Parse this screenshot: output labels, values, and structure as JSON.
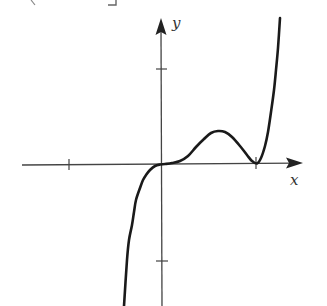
{
  "chart_data": {
    "type": "line",
    "title": "",
    "xlabel": "x",
    "ylabel": "y",
    "x_ticks": [
      -1,
      1
    ],
    "y_ticks": [
      -1,
      1
    ],
    "tick_labels_shown": false,
    "grid": false,
    "legend": null,
    "xlim": [
      -1.5,
      1.5
    ],
    "ylim": [
      -1.5,
      1.5
    ],
    "key_points": [
      {
        "label": "origin inflection",
        "x": 0,
        "y": 0
      },
      {
        "label": "local max",
        "x": 0.6,
        "y": 0.35
      },
      {
        "label": "double root (local min)",
        "x": 1,
        "y": 0
      }
    ],
    "series": [
      {
        "name": "f(x)",
        "points_px": [
          [
            124,
            306
          ],
          [
            127,
            260
          ],
          [
            129,
            240
          ],
          [
            132,
            225
          ],
          [
            134,
            212
          ],
          [
            136,
            200
          ],
          [
            140,
            188
          ],
          [
            143,
            180
          ],
          [
            146,
            175
          ],
          [
            150,
            170
          ],
          [
            155,
            166
          ],
          [
            160,
            164.5
          ],
          [
            165,
            164
          ],
          [
            172,
            163
          ],
          [
            180,
            161
          ],
          [
            188,
            156
          ],
          [
            196,
            147
          ],
          [
            204,
            139
          ],
          [
            211,
            133
          ],
          [
            218,
            131
          ],
          [
            225,
            132
          ],
          [
            232,
            137
          ],
          [
            240,
            146
          ],
          [
            247,
            155
          ],
          [
            252,
            161
          ],
          [
            257,
            163.5
          ],
          [
            261,
            158
          ],
          [
            265,
            146
          ],
          [
            268,
            132
          ],
          [
            271,
            112
          ],
          [
            274,
            90
          ],
          [
            276,
            70
          ],
          [
            278,
            48
          ],
          [
            280,
            18
          ]
        ]
      }
    ]
  },
  "axes": {
    "x_axis": {
      "label": "x",
      "from_px": [
        22,
        165
      ],
      "to_px": [
        303,
        163
      ],
      "ticks_px": [
        69,
        256
      ]
    },
    "y_axis": {
      "label": "y",
      "from_px": [
        162,
        306
      ],
      "to_px": [
        161,
        18
      ],
      "ticks_px": [
        69,
        261
      ]
    }
  },
  "clipped_text_fragments": [
    {
      "glyph": "(",
      "x": 33,
      "y": 0
    },
    {
      "glyph": "]",
      "x": 112,
      "y": 0
    }
  ],
  "colors": {
    "axis": "#444444",
    "curve": "#1a1a1a",
    "label": "#333333",
    "background": "#ffffff"
  }
}
